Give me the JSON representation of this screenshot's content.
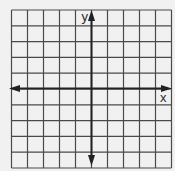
{
  "diagram": {
    "type": "coordinate-plane",
    "grid": {
      "columns": 10,
      "rows": 10,
      "left": 11.5,
      "top": 10,
      "cell_width": 16,
      "cell_height": 15.8,
      "line_color": "#4a4a4a",
      "background_color": "#f1f1f1"
    },
    "axes": {
      "x_axis": {
        "label": "x",
        "row_index": 5,
        "arrows": [
          "left",
          "right"
        ]
      },
      "y_axis": {
        "label": "y",
        "column_index": 5,
        "arrows": [
          "up",
          "down"
        ]
      },
      "color": "#222222"
    }
  }
}
